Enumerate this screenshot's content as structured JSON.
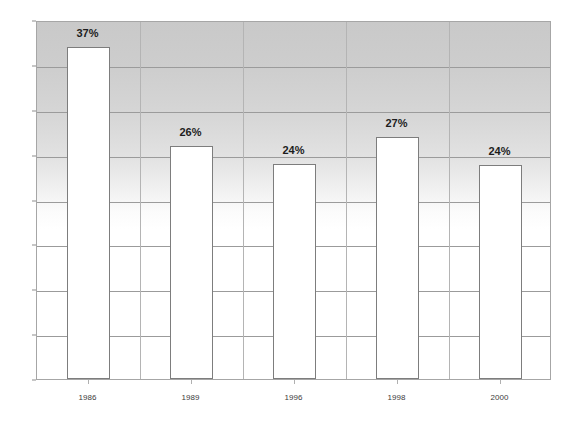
{
  "chart_data": {
    "type": "bar",
    "title": "",
    "subtitle": "",
    "xlabel": "",
    "ylabel": "",
    "categories": [
      "1986",
      "1989",
      "1996",
      "1998",
      "2000"
    ],
    "values": [
      37,
      26,
      24,
      27,
      23.8
    ],
    "data_labels": [
      "37%",
      "26%",
      "24%",
      "27%",
      "24%"
    ],
    "ylim": [
      0,
      40
    ],
    "yticks": [
      0,
      5,
      10,
      15,
      20,
      25,
      30,
      35,
      40
    ],
    "ytick_labels": [
      "0",
      "5",
      "10",
      "15",
      "20",
      "25",
      "30",
      "35",
      "40"
    ],
    "grid": {
      "horizontal": true,
      "vertical": true
    },
    "legend": {
      "visible": false,
      "position": "none",
      "entries": []
    },
    "series": [
      {
        "name": "",
        "values": [
          37,
          26,
          24,
          27,
          23.8
        ]
      }
    ],
    "annotations": [],
    "colors": {
      "bar_fill": "#ffffff",
      "bar_border": "#7d7d7d",
      "plot_background_top": "#c9c9c9",
      "plot_background_bottom": "#ffffff",
      "gridline": "#9b9b9b",
      "axis_text": "#3a3a3a",
      "label_text": "#1d1d1d",
      "plot_border": "#a6a6a6"
    }
  }
}
